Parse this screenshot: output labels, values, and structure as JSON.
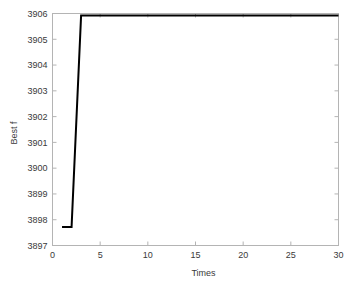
{
  "chart_data": {
    "type": "line",
    "title": "",
    "xlabel": "Times",
    "ylabel": "Best f",
    "xlim": [
      0,
      30
    ],
    "ylim": [
      3897,
      3906
    ],
    "xticks": [
      0,
      5,
      10,
      15,
      20,
      25,
      30
    ],
    "yticks": [
      3897,
      3898,
      3899,
      3900,
      3901,
      3902,
      3903,
      3904,
      3905,
      3906
    ],
    "xtick_labels": [
      "0",
      "5",
      "10",
      "15",
      "20",
      "25",
      "30"
    ],
    "ytick_labels": [
      "3897",
      "3898",
      "3899",
      "3900",
      "3901",
      "3902",
      "3903",
      "3904",
      "3905",
      "3906"
    ],
    "grid": false,
    "legend": null,
    "series": [
      {
        "name": "Best f",
        "color": "#000000",
        "x": [
          1,
          2,
          3,
          4,
          5,
          6,
          7,
          8,
          9,
          10,
          11,
          12,
          13,
          14,
          15,
          16,
          17,
          18,
          19,
          20,
          21,
          22,
          23,
          24,
          25,
          26,
          27,
          28,
          29,
          30
        ],
        "y": [
          3897.72,
          3897.72,
          3905.92,
          3905.92,
          3905.92,
          3905.92,
          3905.92,
          3905.92,
          3905.92,
          3905.92,
          3905.92,
          3905.92,
          3905.92,
          3905.92,
          3905.92,
          3905.92,
          3905.92,
          3905.92,
          3905.92,
          3905.92,
          3905.92,
          3905.92,
          3905.92,
          3905.92,
          3905.92,
          3905.92,
          3905.92,
          3905.92,
          3905.92,
          3905.92
        ]
      }
    ]
  },
  "style": {
    "background": "#ffffff",
    "axis_color": "#b4b4b4",
    "tick_label_color": "#3a3a3a",
    "line_color": "#000000",
    "line_width": 2
  }
}
